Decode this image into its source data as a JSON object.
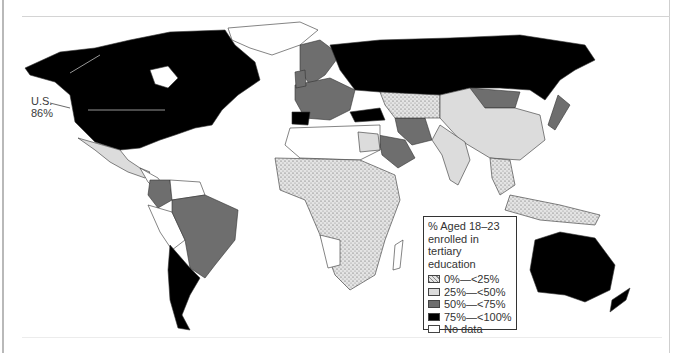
{
  "map": {
    "title": "Tertiary education enrollment by country",
    "callout": {
      "line1": "U.S.",
      "line2": "86%"
    },
    "legend": {
      "title_lines": [
        "% Aged 18–23",
        "enrolled in",
        "tertiary education"
      ],
      "items": [
        {
          "label": "0%—<25%",
          "color": "#d8d8d8",
          "pattern": "stipple"
        },
        {
          "label": "25%—<50%",
          "color": "#dcdcdc",
          "pattern": "solid"
        },
        {
          "label": "50%—<75%",
          "color": "#6e6e6e",
          "pattern": "solid"
        },
        {
          "label": "75%—<100%",
          "color": "#000000",
          "pattern": "solid"
        },
        {
          "label": "No data",
          "color": "#ffffff",
          "pattern": "solid"
        }
      ]
    },
    "regions": {
      "north_america_us_canada": "75%—<100%",
      "mexico": "25%—<50%",
      "brazil": "50%—<75%",
      "colombia": "50%—<75%",
      "argentina_chile": "75%—<100%",
      "russia": "75%—<100%",
      "western_europe": "50%—<75%",
      "mongolia": "50%—<75%",
      "china_india": "25%—<50%",
      "africa_subsaharan": "0%—<25%",
      "saudi_arabia_iran": "50%—<75%",
      "australia": "75%—<100%",
      "japan": "50%—<75%"
    }
  }
}
